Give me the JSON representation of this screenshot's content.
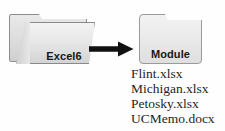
{
  "diagram": {
    "source_folder": {
      "label": "Excel6",
      "icon": "open-folder-icon",
      "fill_color": "#e6e6e6",
      "border_color": "#8a8a8a"
    },
    "arrow": {
      "icon": "right-arrow-icon",
      "color": "#111111",
      "direction": "right"
    },
    "target_folder": {
      "label": "Module",
      "icon": "closed-folder-icon",
      "fill_color": "#ebebeb",
      "border_color": "#9a9a9a"
    },
    "files": [
      {
        "name": "Flint.xlsx"
      },
      {
        "name": "Michigan.xlsx"
      },
      {
        "name": "Petosky.xlsx"
      },
      {
        "name": "UCMemo.docx"
      }
    ]
  }
}
